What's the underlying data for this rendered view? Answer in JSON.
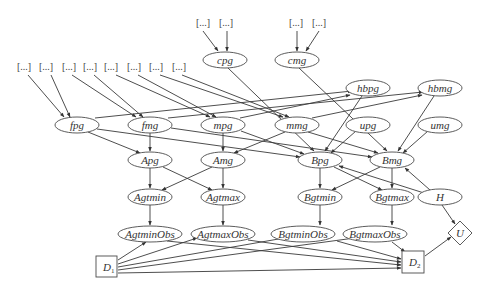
{
  "diagram": {
    "type": "influence-diagram",
    "bracket_label": "[...]",
    "nodes": {
      "cpg": {
        "label": "cpg",
        "shape": "ellipse"
      },
      "cmg": {
        "label": "cmg",
        "shape": "ellipse"
      },
      "fpg": {
        "label": "fpg",
        "shape": "ellipse"
      },
      "fmg": {
        "label": "fmg",
        "shape": "ellipse"
      },
      "mpg": {
        "label": "mpg",
        "shape": "ellipse"
      },
      "mmg": {
        "label": "mmg",
        "shape": "ellipse"
      },
      "hbpg": {
        "label": "hbpg",
        "shape": "ellipse"
      },
      "hbmg": {
        "label": "hbmg",
        "shape": "ellipse"
      },
      "upg": {
        "label": "upg",
        "shape": "ellipse"
      },
      "umg": {
        "label": "umg",
        "shape": "ellipse"
      },
      "Apg": {
        "label": "Apg",
        "shape": "ellipse"
      },
      "Amg": {
        "label": "Amg",
        "shape": "ellipse"
      },
      "Bpg": {
        "label": "Bpg",
        "shape": "ellipse"
      },
      "Bmg": {
        "label": "Bmg",
        "shape": "ellipse"
      },
      "Agtmin": {
        "label": "Agtmin",
        "shape": "ellipse"
      },
      "Agtmax": {
        "label": "Agtmax",
        "shape": "ellipse"
      },
      "Bgtmin": {
        "label": "Bgtmin",
        "shape": "ellipse"
      },
      "Bgtmax": {
        "label": "Bgtmax",
        "shape": "ellipse"
      },
      "H": {
        "label": "H",
        "shape": "ellipse"
      },
      "AgtminObs": {
        "label": "AgtminObs",
        "shape": "ellipse"
      },
      "AgtmaxObs": {
        "label": "AgtmaxObs",
        "shape": "ellipse"
      },
      "BgtminObs": {
        "label": "BgtminObs",
        "shape": "ellipse"
      },
      "BgtmaxObs": {
        "label": "BgtmaxObs",
        "shape": "ellipse"
      },
      "D1": {
        "label": "D",
        "subscript": "1",
        "shape": "square",
        "kind": "decision"
      },
      "D2": {
        "label": "D",
        "subscript": "2",
        "shape": "square",
        "kind": "decision"
      },
      "U": {
        "label": "U",
        "shape": "diamond",
        "kind": "utility"
      }
    },
    "edges": [
      [
        "[...]",
        "cpg"
      ],
      [
        "[...]",
        "cpg"
      ],
      [
        "[...]",
        "cmg"
      ],
      [
        "[...]",
        "cmg"
      ],
      [
        "[...]",
        "fpg"
      ],
      [
        "[...]",
        "fpg"
      ],
      [
        "[...]",
        "fmg"
      ],
      [
        "[...]",
        "fmg"
      ],
      [
        "[...]",
        "mpg"
      ],
      [
        "[...]",
        "mpg"
      ],
      [
        "[...]",
        "mmg"
      ],
      [
        "[...]",
        "mmg"
      ],
      [
        "fpg",
        "hbpg"
      ],
      [
        "fmg",
        "hbmg"
      ],
      [
        "mpg",
        "hbpg"
      ],
      [
        "mmg",
        "hbmg"
      ],
      [
        "fpg",
        "Apg"
      ],
      [
        "fpg",
        "Bpg"
      ],
      [
        "fmg",
        "Apg"
      ],
      [
        "fmg",
        "Bmg"
      ],
      [
        "mpg",
        "Amg"
      ],
      [
        "mpg",
        "Bpg"
      ],
      [
        "mmg",
        "Amg"
      ],
      [
        "mmg",
        "Bmg"
      ],
      [
        "cpg",
        "Bpg"
      ],
      [
        "cmg",
        "Bmg"
      ],
      [
        "hbpg",
        "Bpg"
      ],
      [
        "hbmg",
        "Bmg"
      ],
      [
        "upg",
        "Bpg"
      ],
      [
        "umg",
        "Bmg"
      ],
      [
        "Apg",
        "Agtmin"
      ],
      [
        "Apg",
        "Agtmax"
      ],
      [
        "Amg",
        "Agtmin"
      ],
      [
        "Amg",
        "Agtmax"
      ],
      [
        "Bpg",
        "Bgtmin"
      ],
      [
        "Bpg",
        "Bgtmax"
      ],
      [
        "Bmg",
        "Bgtmin"
      ],
      [
        "Bmg",
        "Bgtmax"
      ],
      [
        "H",
        "Bpg"
      ],
      [
        "H",
        "Bmg"
      ],
      [
        "H",
        "U"
      ],
      [
        "Agtmin",
        "AgtminObs"
      ],
      [
        "Agtmax",
        "AgtmaxObs"
      ],
      [
        "Bgtmin",
        "BgtminObs"
      ],
      [
        "Bgtmax",
        "BgtmaxObs"
      ],
      [
        "D1",
        "AgtminObs"
      ],
      [
        "D1",
        "AgtmaxObs"
      ],
      [
        "D1",
        "BgtminObs"
      ],
      [
        "D1",
        "BgtmaxObs"
      ],
      [
        "D1",
        "D2"
      ],
      [
        "AgtminObs",
        "D2"
      ],
      [
        "AgtmaxObs",
        "D2"
      ],
      [
        "BgtminObs",
        "D2"
      ],
      [
        "BgtmaxObs",
        "D2"
      ],
      [
        "D2",
        "U"
      ]
    ]
  }
}
